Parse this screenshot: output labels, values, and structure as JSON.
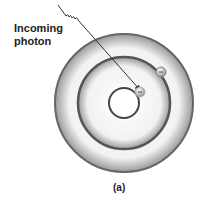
{
  "diagram": {
    "label_line1": "Incoming",
    "label_line2": "photon",
    "caption": "(a)",
    "electron_symbol": "−",
    "colors": {
      "ring": "#555555",
      "arrow": "#333333",
      "background": "#ffffff"
    }
  }
}
